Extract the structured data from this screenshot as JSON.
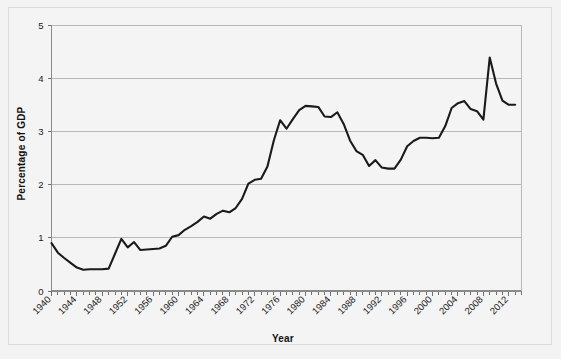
{
  "chart_data": {
    "type": "line",
    "title": "",
    "xlabel": "Year",
    "ylabel": "Percentage of GDP",
    "xlim": [
      1940,
      2014
    ],
    "ylim": [
      0,
      5
    ],
    "ytick_labels": [
      "0",
      "1",
      "2",
      "3",
      "4",
      "5"
    ],
    "ytick_values": [
      0,
      1,
      2,
      3,
      4,
      5
    ],
    "xtick_labels": [
      "1940",
      "1944",
      "1948",
      "1952",
      "1956",
      "1960",
      "1964",
      "1968",
      "1972",
      "1976",
      "1980",
      "1984",
      "1988",
      "1992",
      "1996",
      "2000",
      "2004",
      "2008",
      "2012"
    ],
    "xtick_values": [
      1940,
      1944,
      1948,
      1952,
      1956,
      1960,
      1964,
      1968,
      1972,
      1976,
      1980,
      1984,
      1988,
      1992,
      1996,
      2000,
      2004,
      2008,
      2012
    ],
    "minor_xticks_every": 1,
    "grid": "horizontal",
    "legend": "none",
    "line_color": "#1a1a1a",
    "line_width": 2.1,
    "plot_background": "#f4f4f4",
    "grid_color": "#b9b9b9",
    "x": [
      1940,
      1941,
      1942,
      1943,
      1944,
      1945,
      1946,
      1947,
      1948,
      1949,
      1950,
      1951,
      1952,
      1953,
      1954,
      1955,
      1956,
      1957,
      1958,
      1959,
      1960,
      1961,
      1962,
      1963,
      1964,
      1965,
      1966,
      1967,
      1968,
      1969,
      1970,
      1971,
      1972,
      1973,
      1974,
      1975,
      1976,
      1977,
      1978,
      1979,
      1980,
      1981,
      1982,
      1983,
      1984,
      1985,
      1986,
      1987,
      1988,
      1989,
      1990,
      1991,
      1992,
      1993,
      1994,
      1995,
      1996,
      1997,
      1998,
      1999,
      2000,
      2001,
      2002,
      2003,
      2004,
      2005,
      2006,
      2007,
      2008,
      2009,
      2010,
      2011,
      2012,
      2013
    ],
    "y": [
      0.9,
      0.72,
      0.62,
      0.53,
      0.44,
      0.4,
      0.41,
      0.41,
      0.41,
      0.42,
      0.7,
      0.98,
      0.82,
      0.92,
      0.77,
      0.78,
      0.79,
      0.8,
      0.85,
      1.02,
      1.05,
      1.15,
      1.22,
      1.3,
      1.4,
      1.36,
      1.45,
      1.51,
      1.48,
      1.56,
      1.73,
      2.02,
      2.09,
      2.11,
      2.34,
      2.83,
      3.21,
      3.05,
      3.23,
      3.4,
      3.48,
      3.47,
      3.46,
      3.28,
      3.27,
      3.36,
      3.14,
      2.83,
      2.63,
      2.56,
      2.35,
      2.46,
      2.32,
      2.3,
      2.3,
      2.47,
      2.72,
      2.82,
      2.88,
      2.88,
      2.87,
      2.88,
      3.1,
      3.44,
      3.53,
      3.57,
      3.42,
      3.38,
      3.22,
      4.39,
      3.9,
      3.58,
      3.5,
      3.5
    ]
  },
  "figure": {
    "background": "#f3f3f3",
    "frame_color": "#dcdcdc"
  }
}
